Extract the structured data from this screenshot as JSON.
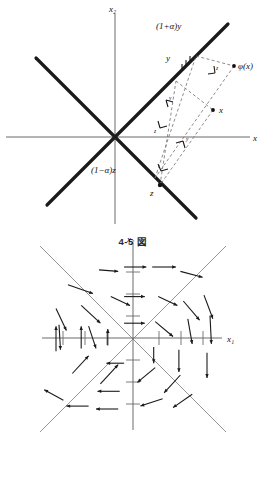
{
  "figures": [
    {
      "id": "vector-decomposition",
      "caption": "4-5 図",
      "axes": {
        "x": "x",
        "y": "x₂"
      },
      "labels": {
        "phi_x": "φ(x)",
        "one_plus_alpha_y": "(1+α)y",
        "one_minus_alpha_z": "(1−α)z",
        "y": "y",
        "z": "z",
        "x": "x",
        "dash_y": "y",
        "dash_z": "z",
        "dash_y2": "y",
        "dash_z2": "z"
      }
    },
    {
      "id": "phase-portrait",
      "caption": "",
      "axes": {
        "x": "x₁",
        "y": "x₂"
      }
    }
  ],
  "colors": {
    "background": "#ffffff",
    "ink": "#1a1a1a",
    "axis": "#6b6b6b",
    "dashed": "#6f6f6f",
    "thin_diagonal": "#8a8a8a"
  },
  "chart_data": {
    "type": "scatter",
    "title": "4-5 図",
    "xlabel": "x₁",
    "ylabel": "x₂",
    "vector_field": [
      {
        "x": -88,
        "y": 72,
        "dx": 34,
        "dy": -12
      },
      {
        "x": -46,
        "y": 92,
        "dx": 26,
        "dy": -2
      },
      {
        "x": -12,
        "y": 96,
        "dx": 30,
        "dy": 0
      },
      {
        "x": 26,
        "y": 96,
        "dx": 32,
        "dy": 0
      },
      {
        "x": 64,
        "y": 90,
        "dx": 30,
        "dy": -8
      },
      {
        "x": -104,
        "y": 40,
        "dx": 14,
        "dy": -30
      },
      {
        "x": -70,
        "y": 44,
        "dx": 26,
        "dy": -24
      },
      {
        "x": -30,
        "y": 56,
        "dx": 26,
        "dy": -12
      },
      {
        "x": -12,
        "y": 56,
        "dx": 28,
        "dy": 0
      },
      {
        "x": 34,
        "y": 56,
        "dx": 26,
        "dy": -12
      },
      {
        "x": 68,
        "y": 50,
        "dx": 22,
        "dy": -26
      },
      {
        "x": 96,
        "y": 58,
        "dx": 12,
        "dy": -32
      },
      {
        "x": -60,
        "y": 16,
        "dx": 10,
        "dy": -30
      },
      {
        "x": -100,
        "y": 18,
        "dx": 2,
        "dy": -34
      },
      {
        "x": -12,
        "y": 20,
        "dx": 28,
        "dy": 0
      },
      {
        "x": 30,
        "y": 22,
        "dx": 24,
        "dy": -20
      },
      {
        "x": 74,
        "y": 26,
        "dx": 6,
        "dy": -34
      },
      {
        "x": 104,
        "y": 30,
        "dx": 2,
        "dy": -38
      },
      {
        "x": -104,
        "y": -18,
        "dx": 0,
        "dy": 34
      },
      {
        "x": -70,
        "y": -14,
        "dx": 0,
        "dy": 30
      },
      {
        "x": -34,
        "y": -10,
        "dx": 0,
        "dy": 22
      },
      {
        "x": 28,
        "y": -12,
        "dx": 0,
        "dy": -22
      },
      {
        "x": 62,
        "y": -16,
        "dx": 0,
        "dy": -30
      },
      {
        "x": 100,
        "y": -20,
        "dx": 0,
        "dy": -34
      },
      {
        "x": -82,
        "y": -48,
        "dx": 22,
        "dy": 24
      },
      {
        "x": -44,
        "y": -62,
        "dx": 24,
        "dy": 26
      },
      {
        "x": -12,
        "y": -34,
        "dx": -24,
        "dy": 0
      },
      {
        "x": 30,
        "y": -40,
        "dx": -24,
        "dy": -20
      },
      {
        "x": 64,
        "y": -50,
        "dx": -22,
        "dy": -24
      },
      {
        "x": -18,
        "y": -72,
        "dx": -30,
        "dy": 0
      },
      {
        "x": -60,
        "y": -92,
        "dx": -30,
        "dy": 0
      },
      {
        "x": -20,
        "y": -96,
        "dx": -30,
        "dy": 0
      },
      {
        "x": -94,
        "y": -84,
        "dx": -26,
        "dy": 14
      },
      {
        "x": 40,
        "y": -82,
        "dx": -30,
        "dy": -10
      },
      {
        "x": 80,
        "y": -76,
        "dx": -26,
        "dy": -18
      }
    ],
    "separatrices": [
      {
        "name": "y = x",
        "slope": 1
      },
      {
        "name": "y = -x",
        "slope": -1
      }
    ]
  }
}
